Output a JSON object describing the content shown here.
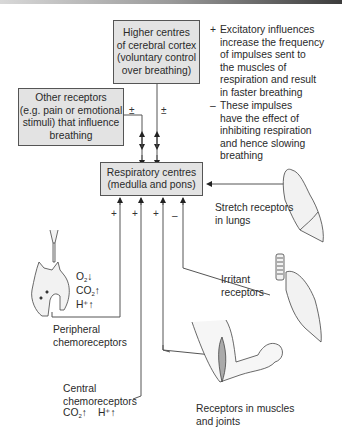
{
  "diagram": {
    "boxes": {
      "higher_centres": [
        "Higher centres",
        "of cerebral cortex",
        "(voluntary control",
        "over breathing)"
      ],
      "other_receptors": [
        "Other receptors",
        "(e.g. pain or emotional",
        "stimuli) that influence",
        "breathing"
      ],
      "respiratory_centres": [
        "Respiratory centres",
        "(medulla and pons)"
      ]
    },
    "legend": {
      "plus_symbol": "+",
      "plus_text": [
        "Excitatory influences",
        "increase the frequency",
        "of impulses sent to",
        "the muscles of",
        "respiration and result",
        "in faster breathing"
      ],
      "minus_symbol": "–",
      "minus_text": [
        "These impulses",
        "have the effect of",
        "inhibiting respiration",
        "and hence slowing",
        "breathing"
      ]
    },
    "signs": {
      "other_receptors": "±",
      "higher_centres": "±",
      "peripheral": "+",
      "central": "+",
      "muscles": "+",
      "irritant": "–"
    },
    "labels": {
      "stretch": [
        "Stretch receptors",
        "in lungs"
      ],
      "irritant": [
        "Irritant",
        "receptors"
      ],
      "peripheral": [
        "Peripheral",
        "chemoreceptors"
      ],
      "central": [
        "Central",
        "chemoreceptors"
      ],
      "muscles": [
        "Receptors in muscles",
        "and joints"
      ]
    },
    "chem": {
      "peripheral_o2": "O",
      "peripheral_o2_sub": "2",
      "peripheral_o2_arrow": "↓",
      "peripheral_co2": "CO",
      "peripheral_co2_sub": "2",
      "peripheral_co2_arrow": "↑",
      "peripheral_h": "H⁺",
      "peripheral_h_arrow": "↑",
      "central_co2": "CO",
      "central_co2_sub": "2",
      "central_co2_arrow": "↑",
      "central_h": "H⁺",
      "central_h_arrow": "↑"
    },
    "colors": {
      "box_fill": "#e3e3e3",
      "line": "#555555",
      "organ_fill": "#f2f2f2"
    }
  }
}
